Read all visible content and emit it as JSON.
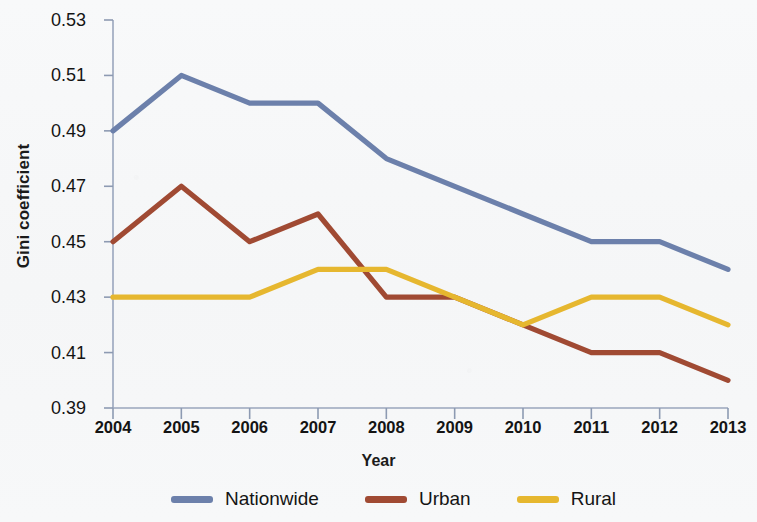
{
  "chart_data": {
    "type": "line",
    "title": "",
    "xlabel": "Year",
    "ylabel": "Gini coefficient",
    "categories": [
      "2004",
      "2005",
      "2006",
      "2007",
      "2008",
      "2009",
      "2010",
      "2011",
      "2012",
      "2013"
    ],
    "x": [
      2004,
      2005,
      2006,
      2007,
      2008,
      2009,
      2010,
      2011,
      2012,
      2013
    ],
    "xlim": [
      2004,
      2013
    ],
    "ylim": [
      0.39,
      0.53
    ],
    "yticks": [
      0.53,
      0.51,
      0.49,
      0.47,
      0.45,
      0.43,
      0.41,
      0.39
    ],
    "ytick_labels": [
      "0.53",
      "0.51",
      "0.49",
      "0.47",
      "0.45",
      "0.43",
      "0.41",
      "0.39"
    ],
    "grid": false,
    "legend_position": "bottom",
    "series": [
      {
        "name": "Nationwide",
        "color": "#6c80ab",
        "values": [
          0.49,
          0.51,
          0.5,
          0.5,
          0.48,
          0.47,
          0.46,
          0.45,
          0.45,
          0.44
        ]
      },
      {
        "name": "Urban",
        "color": "#a04a33",
        "values": [
          0.45,
          0.47,
          0.45,
          0.46,
          0.43,
          0.43,
          0.42,
          0.41,
          0.41,
          0.4
        ]
      },
      {
        "name": "Rural",
        "color": "#e6b72f",
        "values": [
          0.43,
          0.43,
          0.43,
          0.44,
          0.44,
          0.43,
          0.42,
          0.43,
          0.43,
          0.42
        ]
      }
    ]
  },
  "legend": {
    "items": [
      {
        "label": "Nationwide",
        "color": "#6c80ab"
      },
      {
        "label": "Urban",
        "color": "#a04a33"
      },
      {
        "label": "Rural",
        "color": "#e6b72f"
      }
    ]
  },
  "axes": {
    "y_title": "Gini coefficient",
    "x_title": "Year"
  }
}
